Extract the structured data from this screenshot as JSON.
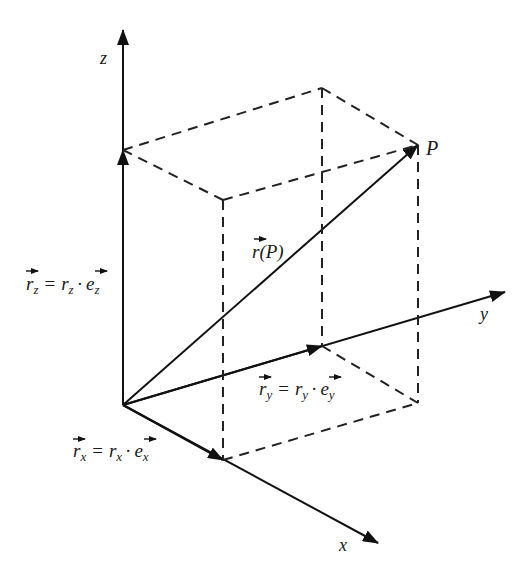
{
  "diagram": {
    "axes": {
      "z": {
        "label": "z"
      },
      "y": {
        "label": "y"
      },
      "x": {
        "label": "x"
      }
    },
    "point": {
      "label": "P"
    },
    "vectors": {
      "r_P": {
        "label_main": "r",
        "label_arg": "(P)"
      },
      "r_z": {
        "lhs": "r",
        "lhs_sub": "z",
        "eq": "=",
        "coef": "r",
        "coef_sub": "z",
        "dot": "·",
        "unit": "e",
        "unit_sub": "z"
      },
      "r_y": {
        "lhs": "r",
        "lhs_sub": "y",
        "eq": "=",
        "coef": "r",
        "coef_sub": "y",
        "dot": "·",
        "unit": "e",
        "unit_sub": "y"
      },
      "r_x": {
        "lhs": "r",
        "lhs_sub": "x",
        "eq": "=",
        "coef": "r",
        "coef_sub": "x",
        "dot": "·",
        "unit": "e",
        "unit_sub": "x"
      }
    },
    "colors": {
      "line": "#111111",
      "background": "#ffffff"
    }
  }
}
